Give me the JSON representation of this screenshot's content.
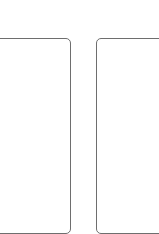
{
  "panels": [
    {
      "id": "left",
      "label": ""
    },
    {
      "id": "right",
      "label": ""
    }
  ],
  "colors": {
    "background": "#ffffff",
    "border": "#6e6e6e"
  }
}
